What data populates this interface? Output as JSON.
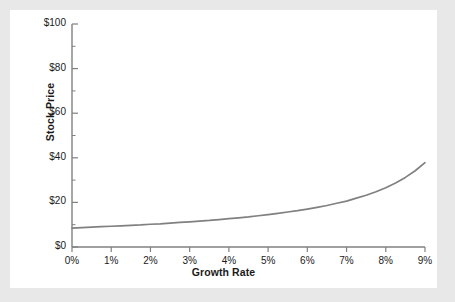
{
  "figure": {
    "background_color": "#e8e8e8",
    "card_color": "#ffffff",
    "line_color": "#808080",
    "axis_color": "#808080",
    "text_color": "#1a1a1a"
  },
  "bleed_top_text": "",
  "bleed_bottom_text": "",
  "chart_data": {
    "type": "line",
    "title": "",
    "xlabel": "Growth Rate",
    "ylabel": "Stock Price",
    "xlim": [
      0,
      9
    ],
    "ylim": [
      0,
      100
    ],
    "grid": false,
    "legend": null,
    "x_tick_labels": [
      "0%",
      "1%",
      "2%",
      "3%",
      "4%",
      "5%",
      "6%",
      "7%",
      "8%",
      "9%"
    ],
    "x_tick_values": [
      0,
      1,
      2,
      3,
      4,
      5,
      6,
      7,
      8,
      9
    ],
    "y_tick_labels": [
      "$0",
      "$20",
      "$40",
      "$60",
      "$80",
      "$100"
    ],
    "y_tick_values": [
      0,
      20,
      40,
      60,
      80,
      100
    ],
    "y_minor_tick_values": [
      10,
      30,
      50,
      70,
      90
    ],
    "series": [
      {
        "name": "Stock Price",
        "color": "#808080",
        "x": [
          0,
          0.25,
          0.5,
          0.75,
          1,
          1.25,
          1.5,
          1.75,
          2,
          2.25,
          2.5,
          2.75,
          3,
          3.25,
          3.5,
          3.75,
          4,
          4.25,
          4.5,
          4.75,
          5,
          5.25,
          5.5,
          5.75,
          6,
          6.25,
          6.5,
          6.75,
          7,
          7.25,
          7.5,
          7.75,
          8,
          8.25,
          8.5,
          8.75,
          9
        ],
        "values": [
          8.5,
          8.7,
          8.9,
          9.1,
          9.3,
          9.5,
          9.7,
          9.9,
          10.2,
          10.4,
          10.7,
          11.0,
          11.3,
          11.6,
          11.9,
          12.3,
          12.7,
          13.1,
          13.5,
          14.0,
          14.5,
          15.1,
          15.7,
          16.3,
          17.0,
          17.8,
          18.6,
          19.6,
          20.6,
          21.9,
          23.2,
          24.8,
          26.6,
          28.7,
          31.2,
          34.2,
          37.8
        ]
      }
    ]
  }
}
